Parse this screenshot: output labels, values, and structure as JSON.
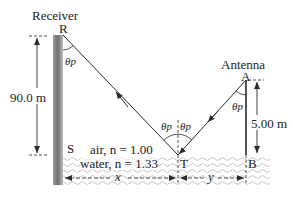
{
  "labels": {
    "receiver": "Receiver",
    "R": "R",
    "antenna": "Antenna",
    "A": "A",
    "S": "S",
    "T": "T",
    "B": "B",
    "height_receiver": "90.0 m",
    "height_antenna": "5.00 m",
    "air": "air, n = 1.00",
    "water": "water, n = 1.33",
    "x": "x",
    "y": "y",
    "theta_p": "θp"
  },
  "colors": {
    "line": "#2a2a2a",
    "wall_dark": "#7a7a7a",
    "wall_light": "#d0d0d0",
    "water_wave": "#bdbdbd"
  }
}
